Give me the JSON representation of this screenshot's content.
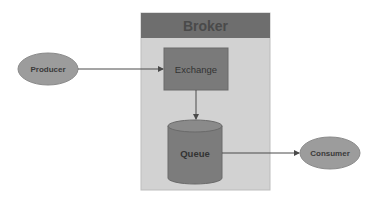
{
  "diagram": {
    "type": "message-broker-flow",
    "broker": {
      "label": "Broker",
      "header_color": "#6e6e6e",
      "body_color": "#d2d2d2"
    },
    "nodes": [
      {
        "id": "producer",
        "label": "Producer",
        "shape": "ellipse",
        "color": "#9c9c9c"
      },
      {
        "id": "exchange",
        "label": "Exchange",
        "shape": "rectangle",
        "color": "#7a7a7a"
      },
      {
        "id": "queue",
        "label": "Queue",
        "shape": "cylinder",
        "color": "#7c7c7c"
      },
      {
        "id": "consumer",
        "label": "Consumer",
        "shape": "ellipse",
        "color": "#9c9c9c"
      }
    ],
    "edges": [
      {
        "from": "producer",
        "to": "exchange"
      },
      {
        "from": "exchange",
        "to": "queue"
      },
      {
        "from": "queue",
        "to": "consumer"
      }
    ]
  }
}
